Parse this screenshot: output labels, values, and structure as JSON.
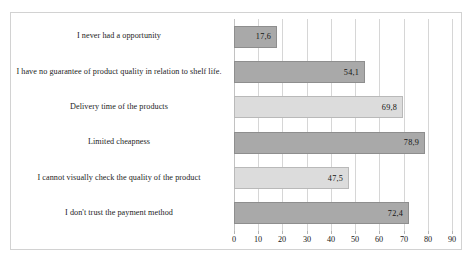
{
  "chart_data": {
    "type": "bar",
    "orientation": "horizontal",
    "title": "",
    "subtitle": "",
    "xlabel": "",
    "ylabel": "",
    "xlim": [
      0,
      90
    ],
    "xticks": [
      "0",
      "10",
      "20",
      "30",
      "40",
      "50",
      "60",
      "70",
      "80",
      "90"
    ],
    "grid": true,
    "legend": false,
    "categories": [
      "I never had a opportunity",
      "I have no guarantee of product quality in relation to shelf life.",
      "Delivery time of the products",
      "Limited cheapness",
      "I cannot visually check the quality of the product",
      "I don't trust the payment method"
    ],
    "values": [
      17.6,
      54.1,
      69.8,
      78.9,
      47.5,
      72.4
    ],
    "value_labels": [
      "17,6",
      "54,1",
      "69,8",
      "78,9",
      "47,5",
      "72,4"
    ],
    "bar_shades": [
      "dark",
      "dark",
      "light",
      "dark",
      "light",
      "dark"
    ],
    "colors": {
      "bar_dark": "#a9a9a9",
      "bar_light": "#dcdcdc",
      "bar_border_dark": "#8e8e8e",
      "bar_border_light": "#b9b9b9",
      "gridline": "#d6d6d6",
      "frame": "#d2d2d2",
      "text": "#1a1a1a",
      "background": "#ffffff"
    }
  },
  "caption": {
    "artifact_text": ""
  }
}
